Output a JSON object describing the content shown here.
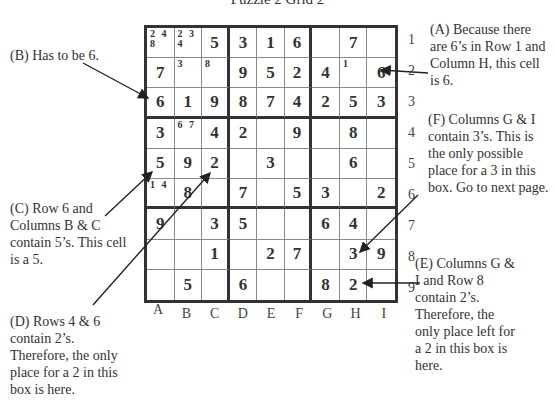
{
  "title": "Puzzle 2  Grid 2",
  "columns": [
    "A",
    "B",
    "C",
    "D",
    "E",
    "F",
    "G",
    "H",
    "I"
  ],
  "rows": [
    "1",
    "2",
    "3",
    "4",
    "5",
    "6",
    "7",
    "8",
    "9"
  ],
  "grid": [
    [
      {
        "v": "",
        "c": "2 4\n8"
      },
      {
        "v": "",
        "c": "2 3\n4"
      },
      {
        "v": "5"
      },
      {
        "v": "3"
      },
      {
        "v": "1"
      },
      {
        "v": "6"
      },
      {
        "v": ""
      },
      {
        "v": "7"
      },
      {
        "v": ""
      }
    ],
    [
      {
        "v": "7"
      },
      {
        "v": "",
        "c": "3"
      },
      {
        "v": "",
        "c": "8"
      },
      {
        "v": "9"
      },
      {
        "v": "5"
      },
      {
        "v": "2"
      },
      {
        "v": "4"
      },
      {
        "v": "",
        "c": "1"
      },
      {
        "v": "6"
      }
    ],
    [
      {
        "v": "6"
      },
      {
        "v": "1"
      },
      {
        "v": "9"
      },
      {
        "v": "8"
      },
      {
        "v": "7"
      },
      {
        "v": "4"
      },
      {
        "v": "2"
      },
      {
        "v": "5"
      },
      {
        "v": "3"
      }
    ],
    [
      {
        "v": "3"
      },
      {
        "v": "",
        "c": "6 7"
      },
      {
        "v": "4"
      },
      {
        "v": "2"
      },
      {
        "v": ""
      },
      {
        "v": "9"
      },
      {
        "v": ""
      },
      {
        "v": "8"
      },
      {
        "v": ""
      }
    ],
    [
      {
        "v": "5"
      },
      {
        "v": "9"
      },
      {
        "v": "2"
      },
      {
        "v": ""
      },
      {
        "v": "3"
      },
      {
        "v": ""
      },
      {
        "v": ""
      },
      {
        "v": "6"
      },
      {
        "v": ""
      }
    ],
    [
      {
        "v": "",
        "c": "1 4"
      },
      {
        "v": "8"
      },
      {
        "v": ""
      },
      {
        "v": "7"
      },
      {
        "v": ""
      },
      {
        "v": "5"
      },
      {
        "v": "3"
      },
      {
        "v": ""
      },
      {
        "v": "2"
      }
    ],
    [
      {
        "v": "9"
      },
      {
        "v": ""
      },
      {
        "v": "3"
      },
      {
        "v": "5"
      },
      {
        "v": ""
      },
      {
        "v": ""
      },
      {
        "v": "6"
      },
      {
        "v": "4"
      },
      {
        "v": ""
      }
    ],
    [
      {
        "v": ""
      },
      {
        "v": ""
      },
      {
        "v": "1"
      },
      {
        "v": ""
      },
      {
        "v": "2"
      },
      {
        "v": "7"
      },
      {
        "v": ""
      },
      {
        "v": "3"
      },
      {
        "v": "9"
      }
    ],
    [
      {
        "v": ""
      },
      {
        "v": "5"
      },
      {
        "v": ""
      },
      {
        "v": "6"
      },
      {
        "v": ""
      },
      {
        "v": ""
      },
      {
        "v": "8"
      },
      {
        "v": "2"
      },
      {
        "v": ""
      }
    ]
  ],
  "notes": {
    "A": "(A) Because there are 6’s in Row 1 and Column H, this cell is 6.",
    "B": "(B) Has to be 6.",
    "C": "(C) Row 6 and Columns B & C contain 5’s. This cell is a 5.",
    "D": "(D) Rows 4 & 6 contain 2’s. Therefore, the only place for a 2 in this box is here.",
    "E": "(E) Columns G & I and Row 8 contain 2’s. Therefore, the only place left for a 2 in this box is here.",
    "F": "(F) Columns G & I contain 3’s. This is the only possible place for a 3 in this box. Go to next page."
  },
  "colors": {
    "grid_line": "#333333",
    "text": "#333333",
    "arrow": "#222222"
  }
}
